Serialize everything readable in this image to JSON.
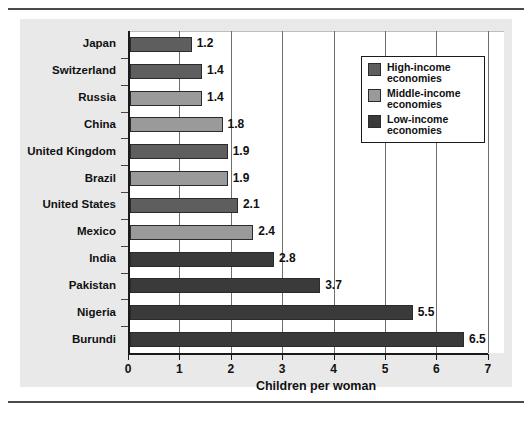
{
  "chart_data": {
    "type": "bar",
    "orientation": "horizontal",
    "title": "",
    "xlabel": "Children per woman",
    "ylabel": "",
    "xlim": [
      0,
      7
    ],
    "xticks": [
      "0",
      "1",
      "2",
      "3",
      "4",
      "5",
      "6",
      "7"
    ],
    "grid": true,
    "legend_position": "top-right",
    "categories": [
      "Japan",
      "Switzerland",
      "Russia",
      "China",
      "United Kingdom",
      "Brazil",
      "United States",
      "Mexico",
      "India",
      "Pakistan",
      "Nigeria",
      "Burundi"
    ],
    "values": [
      1.2,
      1.4,
      1.4,
      1.8,
      1.9,
      1.9,
      2.1,
      2.4,
      2.8,
      3.7,
      5.5,
      6.5
    ],
    "value_labels": [
      "1.2",
      "1.4",
      "1.4",
      "1.8",
      "1.9",
      "1.9",
      "2.1",
      "2.4",
      "2.8",
      "3.7",
      "5.5",
      "6.5"
    ],
    "groups": [
      "high",
      "high",
      "middle",
      "middle",
      "high",
      "middle",
      "high",
      "middle",
      "low",
      "low",
      "low",
      "low"
    ],
    "series": [
      {
        "key": "high",
        "name": "High-income economies",
        "name_line1": "High-income",
        "name_line2": "economies",
        "color": "#5e5e5e"
      },
      {
        "key": "middle",
        "name": "Middle-income economies",
        "name_line1": "Middle-income",
        "name_line2": "economies",
        "color": "#9a9a9a"
      },
      {
        "key": "low",
        "name": "Low-income economies",
        "name_line1": "Low-income",
        "name_line2": "economies",
        "color": "#3a3a3a"
      }
    ]
  },
  "legend": {
    "items": [
      {
        "line1": "High-income",
        "line2": "economies",
        "color": "#5e5e5e"
      },
      {
        "line1": "Middle-income",
        "line2": "economies",
        "color": "#9a9a9a"
      },
      {
        "line1": "Low-income",
        "line2": "economies",
        "color": "#3a3a3a"
      }
    ]
  },
  "axis": {
    "x_title": "Children per woman"
  }
}
